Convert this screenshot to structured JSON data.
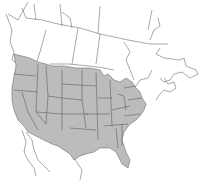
{
  "map": {
    "title": "",
    "region": "North America",
    "colors": {
      "background": "#ffffff",
      "range_fill": "#bcbcbc",
      "border_stroke": "#6e6e6e",
      "state_stroke": "#4f4f4f"
    },
    "legend": [],
    "shaded_region": "Range covering most of the contiguous United States and southern British Columbia"
  }
}
